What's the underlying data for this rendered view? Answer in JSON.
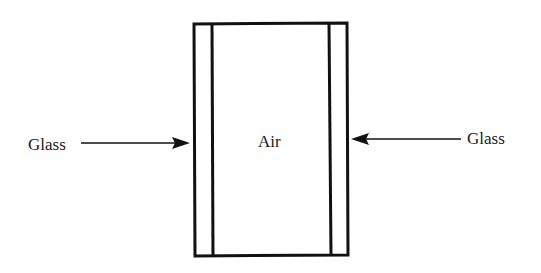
{
  "diagram": {
    "type": "double-glazed window cross-section",
    "labels": {
      "left": "Glass",
      "center": "Air",
      "right": "Glass"
    },
    "layers": [
      {
        "name": "Glass",
        "position": "left"
      },
      {
        "name": "Air",
        "position": "center"
      },
      {
        "name": "Glass",
        "position": "right"
      }
    ],
    "colors": {
      "stroke": "#111111",
      "background": "#ffffff",
      "text": "#1a1a1a"
    }
  }
}
